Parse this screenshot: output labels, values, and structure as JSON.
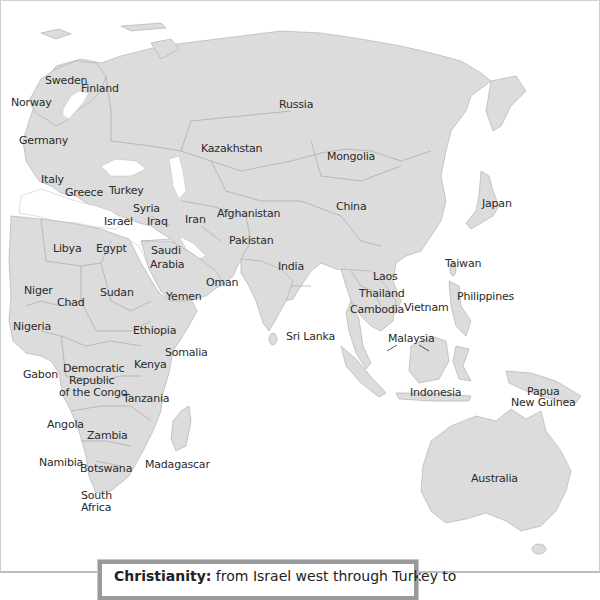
{
  "map": {
    "title": "Religions map (Eastern Hemisphere)",
    "land_color": "#dcdcdc",
    "border_color": "#a8a8a8",
    "water_color": "#ffffff",
    "labels": {
      "sweden": "Sweden",
      "finland": "Finland",
      "norway": "Norway",
      "russia": "Russia",
      "germany": "Germany",
      "kazakhstan": "Kazakhstan",
      "mongolia": "Mongolia",
      "italy": "Italy",
      "greece": "Greece",
      "turkey": "Turkey",
      "syria": "Syria",
      "israel": "Israel",
      "iraq": "Iraq",
      "iran": "Iran",
      "afghanistan": "Afghanistan",
      "china": "China",
      "japan": "Japan",
      "pakistan": "Pakistan",
      "libya": "Libya",
      "egypt": "Egypt",
      "saudi_arabia_1": "Saudi",
      "saudi_arabia_2": "Arabia",
      "india": "India",
      "laos": "Laos",
      "taiwan": "Taiwan",
      "oman": "Oman",
      "niger": "Niger",
      "sudan": "Sudan",
      "yemen": "Yemen",
      "thailand": "Thailand",
      "chad": "Chad",
      "philippines": "Philippines",
      "cambodia": "Cambodia",
      "vietnam": "Vietnam",
      "nigeria": "Nigeria",
      "ethiopia": "Ethiopia",
      "sri_lanka": "Sri Lanka",
      "malaysia": "Malaysia",
      "somalia": "Somalia",
      "kenya": "Kenya",
      "gabon": "Gabon",
      "drc_1": "Democratic",
      "drc_2": "Republic",
      "drc_3": "of the Congo",
      "tanzania": "Tanzania",
      "indonesia": "Indonesia",
      "papua_1": "Papua",
      "papua_2": "New Guinea",
      "angola": "Angola",
      "zambia": "Zambia",
      "namibia": "Namibia",
      "botswana": "Botswana",
      "madagascar": "Madagascar",
      "australia": "Australia",
      "south_africa_1": "South",
      "south_africa_2": "Africa"
    }
  },
  "caption": {
    "bold": "Christianity:",
    "text": " from Israel west through Turkey to"
  }
}
